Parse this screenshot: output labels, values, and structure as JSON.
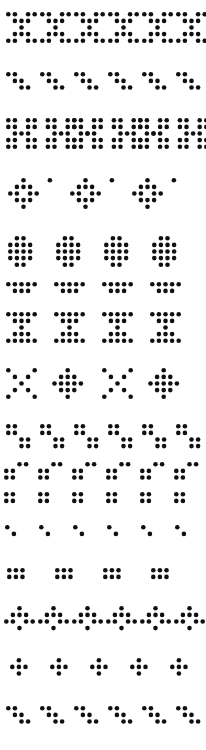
{
  "image": {
    "title": "Dot Matrix Glyph Sheet",
    "width": 206,
    "height": 750,
    "background_color": "#ffffff",
    "dot_color": "#101010",
    "dot_radius": 2.3,
    "cell_pitch_x": 6.6,
    "cell_pitch_y": 6.6
  },
  "legend": {
    "description": "Rows of repeated dot-matrix glyphs rendered as filled circles on a white field.",
    "row_count": 15
  },
  "chart_data": {
    "type": "scatter",
    "subtitle": "",
    "xlabel": "",
    "ylabel": "",
    "xlim": [
      0,
      206
    ],
    "ylim": [
      0,
      750
    ],
    "grid": false,
    "legend_position": "none",
    "marker": "circle",
    "marker_size": 4.6,
    "color": "#101010",
    "rows": [
      {
        "name": "row-1-x-glyph",
        "label": "X glyph row",
        "y_top": 12,
        "glyph": "x5",
        "repeat": 6,
        "origin_x": 6,
        "step_x": 34,
        "cells": [
          [
            0,
            0
          ],
          [
            1,
            0
          ],
          [
            3,
            0
          ],
          [
            4,
            0
          ],
          [
            1,
            1
          ],
          [
            2,
            1
          ],
          [
            3,
            1
          ],
          [
            2,
            2
          ],
          [
            1,
            3
          ],
          [
            2,
            3
          ],
          [
            3,
            3
          ],
          [
            0,
            4
          ],
          [
            1,
            4
          ],
          [
            3,
            4
          ],
          [
            4,
            4
          ]
        ]
      },
      {
        "name": "row-2-backslash",
        "label": "Backslash diagonal row",
        "y_top": 72,
        "glyph": "diag-back",
        "repeat": 6,
        "origin_x": 6,
        "step_x": 34,
        "cells": [
          [
            0,
            0
          ],
          [
            1,
            0
          ],
          [
            1,
            1
          ],
          [
            2,
            1
          ],
          [
            2,
            2
          ],
          [
            3,
            2
          ]
        ]
      },
      {
        "name": "row-3-h-glyph",
        "label": "H glyph pairs with period",
        "y_top": 118,
        "glyph": "h-pair-dot",
        "repeat": 3,
        "origin_x": 6,
        "step_x": 66,
        "cells": [
          [
            0,
            0
          ],
          [
            1,
            0
          ],
          [
            3,
            0
          ],
          [
            4,
            0
          ],
          [
            0,
            1
          ],
          [
            1,
            1
          ],
          [
            3,
            1
          ],
          [
            4,
            1
          ],
          [
            1,
            2
          ],
          [
            2,
            2
          ],
          [
            3,
            2
          ],
          [
            0,
            3
          ],
          [
            1,
            3
          ],
          [
            3,
            3
          ],
          [
            4,
            3
          ],
          [
            0,
            4
          ],
          [
            1,
            4
          ],
          [
            3,
            4
          ],
          [
            4,
            4
          ],
          [
            6,
            0
          ],
          [
            7,
            0
          ],
          [
            9,
            0
          ],
          [
            10,
            0
          ],
          [
            6,
            1
          ],
          [
            7,
            1
          ],
          [
            9,
            1
          ],
          [
            10,
            1
          ],
          [
            7,
            2
          ],
          [
            8,
            2
          ],
          [
            9,
            2
          ],
          [
            6,
            3
          ],
          [
            7,
            3
          ],
          [
            9,
            3
          ],
          [
            10,
            3
          ],
          [
            6,
            4
          ],
          [
            7,
            4
          ],
          [
            9,
            4
          ],
          [
            10,
            4
          ],
          [
            12,
            2
          ]
        ]
      },
      {
        "name": "row-4-diamond",
        "label": "Diamond glyph row with period",
        "y_top": 178,
        "glyph": "diamond-dot",
        "repeat": 3,
        "origin_x": 8,
        "step_x": 62,
        "cells": [
          [
            2,
            0
          ],
          [
            1,
            1
          ],
          [
            2,
            1
          ],
          [
            3,
            1
          ],
          [
            0,
            2
          ],
          [
            1,
            2
          ],
          [
            3,
            2
          ],
          [
            4,
            2
          ],
          [
            1,
            3
          ],
          [
            2,
            3
          ],
          [
            3,
            3
          ],
          [
            2,
            4
          ],
          [
            6,
            0
          ]
        ]
      },
      {
        "name": "row-5-solid-block",
        "label": "Solid block row",
        "y_top": 236,
        "glyph": "block",
        "repeat": 4,
        "origin_x": 8,
        "step_x": 48,
        "cells": [
          [
            1,
            0
          ],
          [
            2,
            0
          ],
          [
            0,
            1
          ],
          [
            1,
            1
          ],
          [
            2,
            1
          ],
          [
            3,
            1
          ],
          [
            0,
            2
          ],
          [
            1,
            2
          ],
          [
            2,
            2
          ],
          [
            3,
            2
          ],
          [
            0,
            3
          ],
          [
            1,
            3
          ],
          [
            2,
            3
          ],
          [
            3,
            3
          ],
          [
            1,
            4
          ],
          [
            2,
            4
          ]
        ]
      },
      {
        "name": "row-6-wide-block",
        "label": "Wide block row",
        "y_top": 282,
        "glyph": "wide-block",
        "repeat": 4,
        "origin_x": 6,
        "step_x": 48,
        "cells": [
          [
            0,
            0
          ],
          [
            1,
            0
          ],
          [
            2,
            0
          ],
          [
            3,
            0
          ],
          [
            4,
            0
          ],
          [
            1,
            1
          ],
          [
            2,
            1
          ],
          [
            3,
            1
          ]
        ]
      },
      {
        "name": "row-7-i-glyph",
        "label": "I glyph row",
        "y_top": 312,
        "glyph": "i5",
        "repeat": 4,
        "origin_x": 6,
        "step_x": 48,
        "cells": [
          [
            0,
            0
          ],
          [
            1,
            0
          ],
          [
            2,
            0
          ],
          [
            3,
            0
          ],
          [
            4,
            0
          ],
          [
            1,
            1
          ],
          [
            2,
            1
          ],
          [
            3,
            1
          ],
          [
            2,
            2
          ],
          [
            1,
            3
          ],
          [
            2,
            3
          ],
          [
            3,
            3
          ],
          [
            0,
            4
          ],
          [
            1,
            4
          ],
          [
            2,
            4
          ],
          [
            3,
            4
          ],
          [
            4,
            4
          ]
        ]
      },
      {
        "name": "row-8-x-diamond-alt",
        "label": "Alternating X and diamond row",
        "y_top": 368,
        "glyph": "x-diamond-alt",
        "repeat": 2,
        "origin_x": 6,
        "step_x": 96,
        "cells": [
          [
            0,
            0
          ],
          [
            4,
            0
          ],
          [
            1,
            1
          ],
          [
            3,
            1
          ],
          [
            2,
            2
          ],
          [
            1,
            3
          ],
          [
            3,
            3
          ],
          [
            0,
            4
          ],
          [
            4,
            4
          ],
          [
            9,
            0
          ],
          [
            8,
            1
          ],
          [
            9,
            1
          ],
          [
            10,
            1
          ],
          [
            7,
            2
          ],
          [
            8,
            2
          ],
          [
            9,
            2
          ],
          [
            10,
            2
          ],
          [
            11,
            2
          ],
          [
            8,
            3
          ],
          [
            9,
            3
          ],
          [
            10,
            3
          ],
          [
            9,
            4
          ]
        ]
      },
      {
        "name": "row-9-step-pairs",
        "label": "Stepped dot pair row",
        "y_top": 424,
        "glyph": "step-pair",
        "repeat": 6,
        "origin_x": 6,
        "step_x": 34,
        "cells": [
          [
            0,
            0
          ],
          [
            1,
            0
          ],
          [
            0,
            1
          ],
          [
            1,
            1
          ],
          [
            2,
            2
          ],
          [
            3,
            2
          ],
          [
            2,
            3
          ],
          [
            3,
            3
          ]
        ]
      },
      {
        "name": "row-10-square-caps",
        "label": "Square with top cap row",
        "y_top": 462,
        "glyph": "square-cap",
        "repeat": 6,
        "origin_x": 4,
        "step_x": 34,
        "cells": [
          [
            2,
            0
          ],
          [
            3,
            0
          ],
          [
            0,
            1
          ],
          [
            1,
            1
          ],
          [
            0,
            2
          ],
          [
            1,
            2
          ]
        ]
      },
      {
        "name": "row-11-squares",
        "label": "Plain 2x2 square row",
        "y_top": 492,
        "glyph": "square2",
        "repeat": 6,
        "origin_x": 4,
        "step_x": 34,
        "cells": [
          [
            0,
            0
          ],
          [
            1,
            0
          ],
          [
            0,
            1
          ],
          [
            1,
            1
          ]
        ]
      },
      {
        "name": "row-12-sparse-diag",
        "label": "Sparse diagonal dot pair row",
        "y_top": 525,
        "glyph": "sparse-diag",
        "repeat": 6,
        "origin_x": 5,
        "step_x": 34,
        "cells": [
          [
            0,
            0
          ],
          [
            1,
            1
          ]
        ]
      },
      {
        "name": "row-13-block-2x3",
        "label": "2 by 3 block row",
        "y_top": 568,
        "glyph": "block23",
        "repeat": 4,
        "origin_x": 7,
        "step_x": 48,
        "cells": [
          [
            0,
            0
          ],
          [
            1,
            0
          ],
          [
            2,
            0
          ],
          [
            0,
            1
          ],
          [
            1,
            1
          ],
          [
            2,
            1
          ]
        ]
      },
      {
        "name": "row-14-zigzag",
        "label": "Zigzag wave row",
        "y_top": 606,
        "glyph": "zigzag",
        "repeat": 6,
        "origin_x": 4,
        "step_x": 34,
        "cells": [
          [
            2,
            0
          ],
          [
            1,
            1
          ],
          [
            2,
            1
          ],
          [
            3,
            1
          ],
          [
            0,
            2
          ],
          [
            1,
            2
          ],
          [
            3,
            2
          ],
          [
            4,
            2
          ],
          [
            2,
            3
          ]
        ]
      },
      {
        "name": "row-15-plus",
        "label": "Plus cross glyph row",
        "y_top": 658,
        "glyph": "plus",
        "repeat": 5,
        "origin_x": 10,
        "step_x": 40,
        "cells": [
          [
            1,
            0
          ],
          [
            0,
            1
          ],
          [
            1,
            1
          ],
          [
            2,
            1
          ],
          [
            1,
            2
          ]
        ]
      },
      {
        "name": "row-16-backslash-bottom",
        "label": "Bottom backslash diagonal row",
        "y_top": 706,
        "glyph": "diag-back",
        "repeat": 6,
        "origin_x": 6,
        "step_x": 34,
        "cells": [
          [
            0,
            0
          ],
          [
            1,
            0
          ],
          [
            1,
            1
          ],
          [
            2,
            1
          ],
          [
            2,
            2
          ],
          [
            3,
            2
          ]
        ]
      }
    ]
  }
}
